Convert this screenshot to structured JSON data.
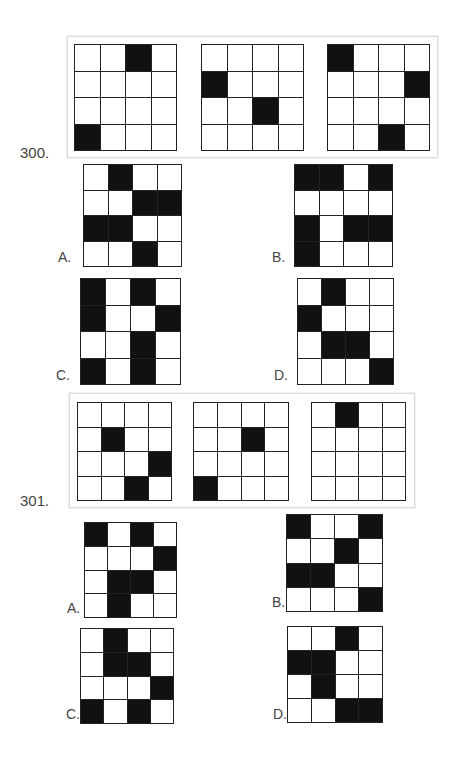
{
  "questions": [
    {
      "number": "300.",
      "sequence": [
        {
          "filled": [
            [
              0,
              2
            ],
            [
              3,
              0
            ]
          ]
        },
        {
          "filled": [
            [
              1,
              0
            ],
            [
              2,
              2
            ]
          ]
        },
        {
          "filled": [
            [
              0,
              0
            ],
            [
              1,
              3
            ],
            [
              3,
              2
            ]
          ]
        }
      ],
      "options": [
        {
          "label": "A.",
          "filled": [
            [
              0,
              1
            ],
            [
              1,
              2
            ],
            [
              1,
              3
            ],
            [
              2,
              0
            ],
            [
              2,
              1
            ],
            [
              3,
              2
            ]
          ]
        },
        {
          "label": "B.",
          "filled": [
            [
              0,
              0
            ],
            [
              0,
              1
            ],
            [
              0,
              3
            ],
            [
              2,
              0
            ],
            [
              2,
              2
            ],
            [
              2,
              3
            ],
            [
              3,
              0
            ]
          ]
        },
        {
          "label": "C.",
          "filled": [
            [
              0,
              0
            ],
            [
              0,
              2
            ],
            [
              1,
              0
            ],
            [
              1,
              3
            ],
            [
              2,
              2
            ],
            [
              3,
              0
            ],
            [
              3,
              2
            ]
          ]
        },
        {
          "label": "D.",
          "filled": [
            [
              0,
              1
            ],
            [
              1,
              0
            ],
            [
              2,
              1
            ],
            [
              2,
              2
            ],
            [
              3,
              3
            ]
          ]
        }
      ]
    },
    {
      "number": "301.",
      "sequence": [
        {
          "filled": [
            [
              1,
              1
            ],
            [
              2,
              3
            ],
            [
              3,
              2
            ]
          ]
        },
        {
          "filled": [
            [
              1,
              2
            ],
            [
              3,
              0
            ]
          ]
        },
        {
          "filled": [
            [
              0,
              1
            ]
          ]
        }
      ],
      "options": [
        {
          "label": "A.",
          "filled": [
            [
              0,
              0
            ],
            [
              0,
              2
            ],
            [
              1,
              3
            ],
            [
              2,
              1
            ],
            [
              2,
              2
            ],
            [
              3,
              1
            ]
          ]
        },
        {
          "label": "B.",
          "filled": [
            [
              0,
              0
            ],
            [
              0,
              3
            ],
            [
              1,
              2
            ],
            [
              2,
              0
            ],
            [
              2,
              1
            ],
            [
              3,
              3
            ]
          ]
        },
        {
          "label": "C.",
          "filled": [
            [
              0,
              1
            ],
            [
              1,
              1
            ],
            [
              1,
              2
            ],
            [
              2,
              3
            ],
            [
              3,
              0
            ],
            [
              3,
              2
            ]
          ]
        },
        {
          "label": "D.",
          "filled": [
            [
              0,
              2
            ],
            [
              1,
              0
            ],
            [
              1,
              1
            ],
            [
              2,
              1
            ],
            [
              3,
              2
            ],
            [
              3,
              3
            ]
          ]
        }
      ]
    }
  ]
}
